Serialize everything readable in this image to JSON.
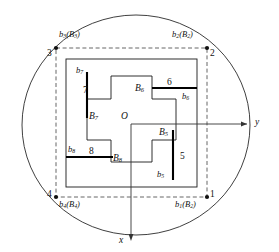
{
  "figure": {
    "type": "geometric-diagram",
    "colors": {
      "stroke": "#1a1a1a",
      "dashed": "#555555",
      "thick": "#000000",
      "background": "#ffffff"
    }
  },
  "axes": {
    "y_label": "y",
    "x_label": "x",
    "origin_label": "O"
  },
  "corners": [
    {
      "id": "1",
      "number": "1",
      "label_b": "b",
      "label_b_sub": "1",
      "label_B": "B",
      "label_B_sub": "2",
      "text": "b1(B2)"
    },
    {
      "id": "2",
      "number": "2",
      "label_b": "b",
      "label_b_sub": "2",
      "label_B": "B",
      "label_B_sub": "2",
      "text": "b2(B2)"
    },
    {
      "id": "3",
      "number": "3",
      "label_b": "b",
      "label_b_sub": "3",
      "label_B": "B",
      "label_B_sub": "3",
      "text": "b3(B3)"
    },
    {
      "id": "4",
      "number": "4",
      "label_b": "b",
      "label_b_sub": "4",
      "label_B": "B",
      "label_B_sub": "4",
      "text": "b4(B4)"
    }
  ],
  "boundary_labels": {
    "b5": {
      "b": "b",
      "sub": "5"
    },
    "b6": {
      "b": "b",
      "sub": "6"
    },
    "b7": {
      "b": "b",
      "sub": "7"
    },
    "b8": {
      "b": "b",
      "sub": "8"
    },
    "B5": {
      "b": "B",
      "sub": "5"
    },
    "B6": {
      "b": "B",
      "sub": "6"
    },
    "B7": {
      "b": "B",
      "sub": "7"
    },
    "B8": {
      "b": "B",
      "sub": "8"
    }
  },
  "region_numbers": {
    "n5": "5",
    "n6": "6",
    "n7": "7",
    "n8": "8"
  },
  "corner_numbers": {
    "c1": "1",
    "c2": "2",
    "c3": "3",
    "c4": "4"
  }
}
